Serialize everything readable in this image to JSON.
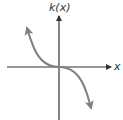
{
  "graph": {
    "y_axis_label": "k(x)",
    "x_axis_label": "x",
    "function_name": "k",
    "description": "Decreasing cubic-like curve passing through the origin, flattening at origin, arrows on both ends",
    "colors": {
      "axes": "#333333",
      "curve": "#808080",
      "background": "#ffffff"
    }
  }
}
